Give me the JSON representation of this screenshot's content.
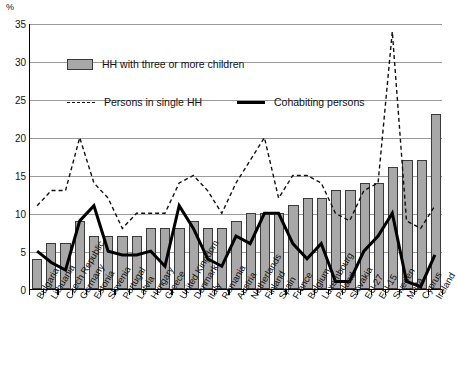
{
  "axis": {
    "unit_label": "%",
    "y_ticks": [
      0,
      5,
      10,
      15,
      20,
      25,
      30,
      35
    ],
    "ylim": [
      0,
      35
    ]
  },
  "legend": {
    "bars_label": "HH with three or more children",
    "dashed_label": "Persons in single HH",
    "solid_label": "Cohabiting persons"
  },
  "chart_data": {
    "type": "bar",
    "title": "",
    "subtitle": "",
    "xlabel": "",
    "ylabel": "%",
    "ylim": [
      0,
      35
    ],
    "grid": true,
    "legend_position": "top-left inside plot",
    "categories": [
      "Bulgaria",
      "Lithuania",
      "Czech Republic",
      "Germany",
      "Estonia",
      "Slovenia",
      "Portugal",
      "Latvia",
      "Hungary",
      "Greece",
      "United Kingdom",
      "Denmark",
      "Italy",
      "Romania",
      "Austria",
      "Netherlands",
      "Finland",
      "Spain",
      "France",
      "Belgium",
      "Luxembourg",
      "Poland",
      "Slovakia",
      "EU-27",
      "EU-15",
      "Sweden",
      "Malta",
      "Cyprus",
      "Ireland"
    ],
    "series": [
      {
        "name": "HH with three or more children",
        "type": "bar",
        "color": "#a8a8a8",
        "values": [
          4,
          6,
          6,
          9,
          7,
          7,
          7,
          7,
          8,
          8,
          8,
          9,
          8,
          8,
          9,
          10,
          10,
          10,
          11,
          12,
          12,
          13,
          13,
          14,
          14,
          16,
          17,
          17,
          23
        ]
      },
      {
        "name": "Persons in single HH",
        "type": "line",
        "style": "dashed",
        "color": "#111111",
        "values": [
          11,
          13,
          13,
          20,
          14,
          12,
          8,
          10,
          10,
          10,
          14,
          15,
          13,
          10,
          14,
          17,
          20,
          12,
          15,
          15,
          14,
          10,
          9,
          13,
          14,
          34,
          9,
          8,
          11
        ]
      },
      {
        "name": "Cohabiting persons",
        "type": "line",
        "style": "solid",
        "color": "#000000",
        "values": [
          5,
          3.5,
          2.5,
          9,
          11,
          5,
          4.5,
          4.5,
          5,
          3,
          11,
          8,
          4,
          3,
          7,
          6,
          10,
          10,
          6,
          4,
          6,
          1,
          1,
          5,
          7,
          10,
          1,
          0.3,
          4.5
        ]
      }
    ]
  }
}
